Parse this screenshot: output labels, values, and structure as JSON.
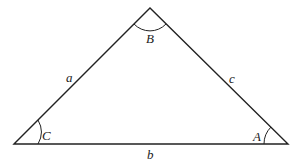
{
  "diagram": {
    "type": "triangle",
    "vertices": [
      {
        "id": "C",
        "angle_label": "C"
      },
      {
        "id": "B",
        "angle_label": "B"
      },
      {
        "id": "A",
        "angle_label": "A"
      }
    ],
    "sides": [
      {
        "id": "a",
        "label": "a",
        "between": [
          "C",
          "B"
        ]
      },
      {
        "id": "c",
        "label": "c",
        "between": [
          "B",
          "A"
        ]
      },
      {
        "id": "b",
        "label": "b",
        "between": [
          "C",
          "A"
        ]
      }
    ],
    "colors": {
      "stroke": "#222222",
      "background": "#ffffff"
    }
  }
}
